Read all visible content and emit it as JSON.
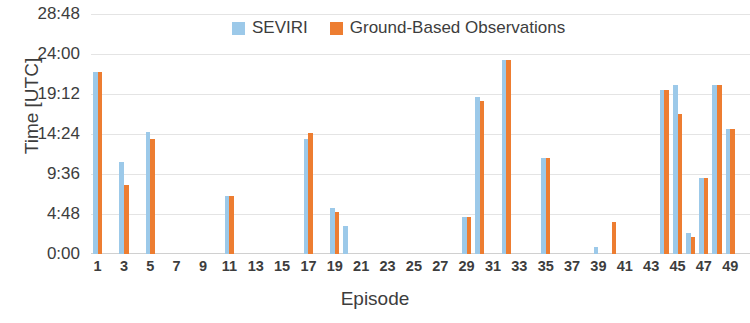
{
  "chart_data": {
    "type": "bar",
    "title": "",
    "xlabel": "Episode",
    "ylabel": "Time [UTC]",
    "grid": true,
    "legend_position": "top-center",
    "ytick_labels": [
      "0:00",
      "4:48",
      "9:36",
      "14:24",
      "19:12",
      "24:00",
      "28:48"
    ],
    "ytick_values": [
      0,
      4.8,
      9.6,
      14.4,
      19.2,
      24.0,
      28.8
    ],
    "ylim": [
      0,
      28.8
    ],
    "xlim": [
      0.5,
      50.5
    ],
    "xtick_labels": [
      "1",
      "3",
      "5",
      "7",
      "9",
      "11",
      "13",
      "15",
      "17",
      "19",
      "21",
      "23",
      "25",
      "27",
      "29",
      "31",
      "33",
      "35",
      "37",
      "39",
      "41",
      "43",
      "45",
      "47",
      "49"
    ],
    "categories": [
      1,
      2,
      3,
      4,
      5,
      6,
      7,
      8,
      9,
      10,
      11,
      12,
      13,
      14,
      15,
      16,
      17,
      18,
      19,
      20,
      21,
      22,
      23,
      24,
      25,
      26,
      27,
      28,
      29,
      30,
      31,
      32,
      33,
      34,
      35,
      36,
      37,
      38,
      39,
      40,
      41,
      42,
      43,
      44,
      45,
      46,
      47,
      48,
      49,
      50
    ],
    "series": [
      {
        "name": "SEVIRI",
        "color": "#9CC9E9",
        "values": [
          21.83,
          null,
          11.0,
          null,
          14.67,
          null,
          null,
          null,
          null,
          null,
          7.0,
          null,
          null,
          null,
          null,
          null,
          13.83,
          null,
          5.5,
          3.33,
          null,
          null,
          null,
          null,
          null,
          null,
          null,
          null,
          4.5,
          18.83,
          null,
          23.33,
          null,
          null,
          11.5,
          null,
          null,
          null,
          0.83,
          null,
          null,
          null,
          null,
          19.67,
          20.33,
          2.5,
          9.17,
          20.33,
          15.0,
          null
        ]
      },
      {
        "name": "Ground-Based Observations",
        "color": "#ED7D31",
        "values": [
          21.83,
          null,
          8.33,
          null,
          13.83,
          null,
          null,
          null,
          null,
          null,
          7.0,
          null,
          null,
          null,
          null,
          null,
          14.5,
          null,
          5.0,
          null,
          null,
          null,
          null,
          null,
          null,
          null,
          null,
          null,
          4.5,
          18.33,
          null,
          23.33,
          null,
          null,
          11.5,
          null,
          null,
          null,
          null,
          3.83,
          null,
          null,
          null,
          19.67,
          16.83,
          2.0,
          9.17,
          20.33,
          15.0,
          null
        ]
      }
    ]
  },
  "legend": {
    "items": [
      {
        "label": "SEVIRI",
        "color": "#9CC9E9"
      },
      {
        "label": "Ground-Based Observations",
        "color": "#ED7D31"
      }
    ]
  },
  "axes": {
    "y_title": "Time [UTC]",
    "x_title": "Episode"
  }
}
